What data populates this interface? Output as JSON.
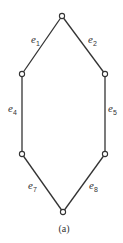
{
  "diagram": {
    "caption": "(a)",
    "nodes": [
      {
        "id": "n_top",
        "x": 62,
        "y": 16
      },
      {
        "id": "n_left_upper",
        "x": 22,
        "y": 74
      },
      {
        "id": "n_right_upper",
        "x": 105,
        "y": 74
      },
      {
        "id": "n_left_lower",
        "x": 22,
        "y": 154
      },
      {
        "id": "n_right_lower",
        "x": 105,
        "y": 154
      },
      {
        "id": "n_bottom",
        "x": 63,
        "y": 212
      }
    ],
    "edges": [
      {
        "label_base": "e",
        "label_sub": "1",
        "from": "n_top",
        "to": "n_left_upper"
      },
      {
        "label_base": "e",
        "label_sub": "2",
        "from": "n_top",
        "to": "n_right_upper"
      },
      {
        "label_base": "e",
        "label_sub": "4",
        "from": "n_left_upper",
        "to": "n_left_lower"
      },
      {
        "label_base": "e",
        "label_sub": "5",
        "from": "n_right_upper",
        "to": "n_right_lower"
      },
      {
        "label_base": "e",
        "label_sub": "7",
        "from": "n_left_lower",
        "to": "n_bottom"
      },
      {
        "label_base": "e",
        "label_sub": "8",
        "from": "n_right_lower",
        "to": "n_bottom"
      }
    ]
  }
}
